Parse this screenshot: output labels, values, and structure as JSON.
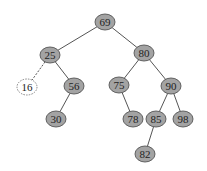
{
  "diagram": {
    "type": "binary-search-tree",
    "colors": {
      "node_fill": "#a3a3a3",
      "node_stroke": "#555555",
      "edge": "#555555",
      "text": "#222222",
      "placeholder_fill": "#ffffff",
      "placeholder_stroke": "#777777"
    },
    "nodes": [
      {
        "id": "n69",
        "label": "69",
        "x": 105,
        "y": 22,
        "style": "solid"
      },
      {
        "id": "n25",
        "label": "25",
        "x": 50,
        "y": 55,
        "style": "solid"
      },
      {
        "id": "n80",
        "label": "80",
        "x": 144,
        "y": 53,
        "style": "solid"
      },
      {
        "id": "n16",
        "label": "16",
        "x": 27,
        "y": 87,
        "style": "dashed"
      },
      {
        "id": "n56",
        "label": "56",
        "x": 74,
        "y": 86,
        "style": "solid"
      },
      {
        "id": "n75",
        "label": "75",
        "x": 119,
        "y": 85,
        "style": "solid"
      },
      {
        "id": "n90",
        "label": "90",
        "x": 171,
        "y": 86,
        "style": "solid"
      },
      {
        "id": "n30",
        "label": "30",
        "x": 56,
        "y": 119,
        "style": "solid"
      },
      {
        "id": "n78",
        "label": "78",
        "x": 133,
        "y": 119,
        "style": "solid"
      },
      {
        "id": "n85",
        "label": "85",
        "x": 156,
        "y": 119,
        "style": "solid"
      },
      {
        "id": "n98",
        "label": "98",
        "x": 183,
        "y": 119,
        "style": "solid"
      },
      {
        "id": "n82",
        "label": "82",
        "x": 145,
        "y": 154,
        "style": "solid"
      }
    ],
    "edges": [
      {
        "from": "n69",
        "to": "n25",
        "style": "solid"
      },
      {
        "from": "n69",
        "to": "n80",
        "style": "solid"
      },
      {
        "from": "n25",
        "to": "n16",
        "style": "dashed"
      },
      {
        "from": "n25",
        "to": "n56",
        "style": "solid"
      },
      {
        "from": "n56",
        "to": "n30",
        "style": "solid"
      },
      {
        "from": "n80",
        "to": "n75",
        "style": "solid"
      },
      {
        "from": "n80",
        "to": "n90",
        "style": "solid"
      },
      {
        "from": "n75",
        "to": "n78",
        "style": "solid"
      },
      {
        "from": "n90",
        "to": "n85",
        "style": "solid"
      },
      {
        "from": "n90",
        "to": "n98",
        "style": "solid"
      },
      {
        "from": "n85",
        "to": "n82",
        "style": "solid"
      }
    ]
  }
}
